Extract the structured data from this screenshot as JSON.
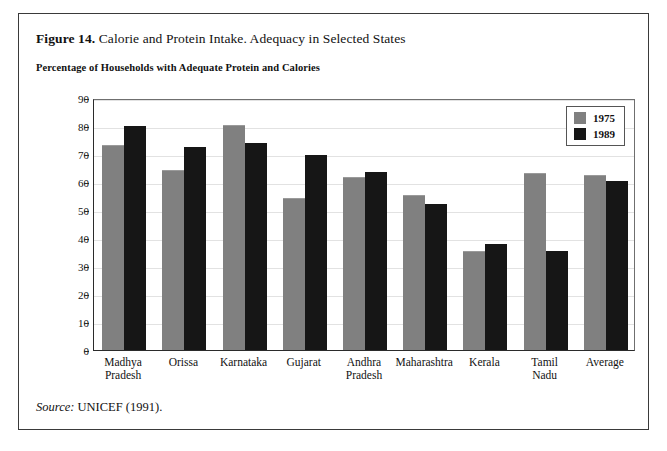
{
  "figure": {
    "number_label": "Figure 14.",
    "title": "Calorie and Protein Intake. Adequacy in Selected States",
    "subtitle": "Percentage of Households with Adequate Protein and Calories",
    "source_label": "Source:",
    "source_text": "UNICEF (1991)."
  },
  "colors": {
    "series_1975": "#808080",
    "series_1989": "#161616",
    "frame": "#3a3a3a",
    "axis": "#2b2b2b",
    "gridline": "#e2e2e2"
  },
  "chart_data": {
    "type": "bar",
    "title": "Percentage of Households with Adequate Protein and Calories",
    "xlabel": "",
    "ylabel": "",
    "ylim": [
      0,
      90
    ],
    "yticks": [
      0,
      10,
      20,
      30,
      40,
      50,
      60,
      70,
      80,
      90
    ],
    "grid": true,
    "legend_position": "top-right",
    "categories": [
      "Madhya Pradesh",
      "Orissa",
      "Karnataka",
      "Gujarat",
      "Andhra Pradesh",
      "Maharashtra",
      "Kerala",
      "Tamil Nadu",
      "Average"
    ],
    "category_lines": [
      [
        "Madhya",
        "Pradesh"
      ],
      [
        "Orissa"
      ],
      [
        "Karnataka"
      ],
      [
        "Gujarat"
      ],
      [
        "Andhra",
        "Pradesh"
      ],
      [
        "Maharashtra"
      ],
      [
        "Kerala"
      ],
      [
        "Tamil",
        "Nadu"
      ],
      [
        "Average"
      ]
    ],
    "series": [
      {
        "name": "1975",
        "color": "#808080",
        "values": [
          73,
          64,
          80,
          54,
          61.5,
          55,
          35,
          63,
          62
        ]
      },
      {
        "name": "1989",
        "color": "#161616",
        "values": [
          80,
          72.5,
          74,
          69.5,
          63.5,
          52,
          38,
          35.5,
          60.5
        ]
      }
    ]
  }
}
